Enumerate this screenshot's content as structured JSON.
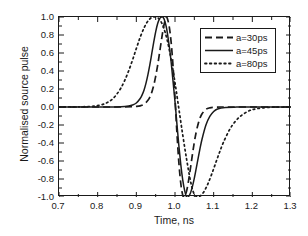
{
  "chart_data": {
    "type": "line",
    "title": "",
    "xlabel": "Time, ns",
    "ylabel": "Normalised source pulse",
    "xlim": [
      0.7,
      1.3
    ],
    "ylim": [
      -1.0,
      1.0
    ],
    "grid": false,
    "legend_position": "upper right",
    "xticks": [
      "0.7",
      "0.8",
      "0.9",
      "1.0",
      "1.1",
      "1.2",
      "1.3"
    ],
    "xtick_values": [
      0.7,
      0.8,
      0.9,
      1.0,
      1.1,
      1.2,
      1.3
    ],
    "yticks": [
      "1.0",
      "0.8",
      "0.6",
      "0.4",
      "0.2",
      "0.0",
      "-0.2",
      "-0.4",
      "-0.6",
      "-0.8",
      "-1.0"
    ],
    "ytick_values": [
      1.0,
      0.8,
      0.6,
      0.4,
      0.2,
      0.0,
      -0.2,
      -0.4,
      -0.6,
      -0.8,
      -1.0
    ],
    "series": [
      {
        "name": "a=30ps",
        "style": "dashed",
        "color": "#1a1a1a",
        "peak_x": 0.977,
        "peak_y": 1.0,
        "trough_x": 1.023,
        "trough_y": -1.0,
        "zero_cross_x": 1.0,
        "width_ps": 30,
        "x": [
          0.7,
          0.75,
          0.8,
          0.84,
          0.87,
          0.89,
          0.9,
          0.91,
          0.92,
          0.93,
          0.935,
          0.94,
          0.945,
          0.95,
          0.955,
          0.96,
          0.965,
          0.97,
          0.975,
          0.977,
          0.98,
          0.985,
          0.99,
          0.995,
          1.0,
          1.005,
          1.01,
          1.015,
          1.02,
          1.023,
          1.025,
          1.03,
          1.035,
          1.04,
          1.045,
          1.05,
          1.055,
          1.06,
          1.065,
          1.07,
          1.08,
          1.09,
          1.1,
          1.12,
          1.15,
          1.2,
          1.25,
          1.3
        ],
        "y": [
          0.0,
          0.0,
          0.0,
          0.0,
          0.001,
          0.003,
          0.006,
          0.013,
          0.03,
          0.075,
          0.11,
          0.165,
          0.24,
          0.34,
          0.46,
          0.6,
          0.745,
          0.88,
          0.975,
          1.0,
          0.985,
          0.895,
          0.72,
          0.45,
          0.1,
          -0.29,
          -0.62,
          -0.85,
          -0.98,
          -1.0,
          -0.995,
          -0.935,
          -0.82,
          -0.68,
          -0.53,
          -0.39,
          -0.275,
          -0.185,
          -0.12,
          -0.075,
          -0.026,
          -0.009,
          -0.003,
          0.0,
          0.0,
          0.0,
          0.0,
          0.0
        ]
      },
      {
        "name": "a=45ps",
        "style": "solid",
        "color": "#1a1a1a",
        "peak_x": 0.968,
        "peak_y": 1.0,
        "trough_x": 1.03,
        "trough_y": -1.0,
        "zero_cross_x": 1.0,
        "width_ps": 45,
        "x": [
          0.7,
          0.75,
          0.8,
          0.83,
          0.86,
          0.88,
          0.89,
          0.9,
          0.91,
          0.915,
          0.92,
          0.925,
          0.93,
          0.935,
          0.94,
          0.945,
          0.95,
          0.955,
          0.96,
          0.965,
          0.968,
          0.972,
          0.978,
          0.985,
          0.99,
          1.0,
          1.005,
          1.01,
          1.015,
          1.02,
          1.025,
          1.03,
          1.035,
          1.04,
          1.045,
          1.05,
          1.055,
          1.06,
          1.065,
          1.07,
          1.08,
          1.09,
          1.1,
          1.11,
          1.13,
          1.16,
          1.2,
          1.25,
          1.3
        ],
        "y": [
          0.0,
          0.0,
          0.0,
          0.001,
          0.004,
          0.012,
          0.022,
          0.045,
          0.095,
          0.135,
          0.19,
          0.265,
          0.36,
          0.47,
          0.595,
          0.72,
          0.835,
          0.925,
          0.98,
          0.999,
          1.0,
          0.975,
          0.88,
          0.68,
          0.5,
          0.06,
          -0.19,
          -0.43,
          -0.64,
          -0.81,
          -0.93,
          -1.0,
          -0.995,
          -0.955,
          -0.885,
          -0.79,
          -0.68,
          -0.565,
          -0.455,
          -0.355,
          -0.2,
          -0.105,
          -0.05,
          -0.022,
          -0.005,
          -0.001,
          0.0,
          0.0,
          0.0
        ]
      },
      {
        "name": "a=80ps",
        "style": "dotted",
        "color": "#1a1a1a",
        "peak_x": 0.955,
        "peak_y": 1.0,
        "trough_x": 1.047,
        "trough_y": -1.0,
        "zero_cross_x": 1.0,
        "width_ps": 80,
        "x": [
          0.7,
          0.74,
          0.77,
          0.79,
          0.81,
          0.82,
          0.83,
          0.84,
          0.85,
          0.86,
          0.87,
          0.88,
          0.89,
          0.9,
          0.91,
          0.92,
          0.93,
          0.94,
          0.95,
          0.955,
          0.962,
          0.97,
          0.98,
          0.99,
          1.0,
          1.01,
          1.02,
          1.03,
          1.04,
          1.047,
          1.055,
          1.065,
          1.075,
          1.085,
          1.095,
          1.105,
          1.115,
          1.125,
          1.14,
          1.155,
          1.17,
          1.19,
          1.21,
          1.24,
          1.27,
          1.3
        ],
        "y": [
          0.0,
          0.001,
          0.004,
          0.01,
          0.025,
          0.04,
          0.062,
          0.095,
          0.145,
          0.21,
          0.295,
          0.4,
          0.52,
          0.65,
          0.775,
          0.88,
          0.955,
          0.995,
          1.0,
          0.995,
          0.96,
          0.89,
          0.74,
          0.53,
          0.27,
          -0.02,
          -0.31,
          -0.58,
          -0.82,
          -0.94,
          -0.995,
          -0.99,
          -0.94,
          -0.855,
          -0.745,
          -0.625,
          -0.505,
          -0.395,
          -0.26,
          -0.165,
          -0.1,
          -0.045,
          -0.02,
          -0.005,
          -0.001,
          0.0
        ]
      }
    ]
  },
  "legend": {
    "entries": [
      {
        "label": "a=30ps",
        "style": "dashed"
      },
      {
        "label": "a=45ps",
        "style": "solid"
      },
      {
        "label": "a=80ps",
        "style": "dotted"
      }
    ]
  },
  "axis": {
    "x_title": "Time, ns",
    "y_title": "Normalised source pulse"
  },
  "colors": {
    "ink": "#1a1a1a",
    "background": "#ffffff"
  }
}
